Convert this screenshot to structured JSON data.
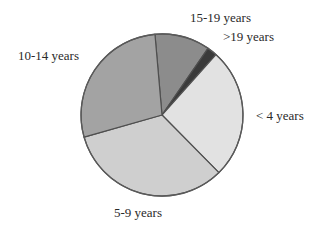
{
  "chart_data": {
    "type": "pie",
    "title": "",
    "categories": [
      "15-19 years",
      ">19 years",
      "< 4 years",
      "5-9 years",
      "10-14 years"
    ],
    "values": [
      11,
      2,
      26,
      33,
      28
    ],
    "unit": "%",
    "start_angle_deg": -5,
    "direction": "clockwise",
    "colors": [
      "#8c8c8c",
      "#3a3a3a",
      "#e2e2e2",
      "#cfcfcf",
      "#a3a3a3"
    ],
    "legend": "none (direct labels)",
    "labels": [
      {
        "text": "15-19 years",
        "x": 190,
        "y": 10
      },
      {
        "text": ">19 years",
        "x": 223,
        "y": 29
      },
      {
        "text": "< 4 years",
        "x": 256,
        "y": 108
      },
      {
        "text": "5-9 years",
        "x": 114,
        "y": 205
      },
      {
        "text": "10-14 years",
        "x": 18,
        "y": 48
      }
    ]
  }
}
